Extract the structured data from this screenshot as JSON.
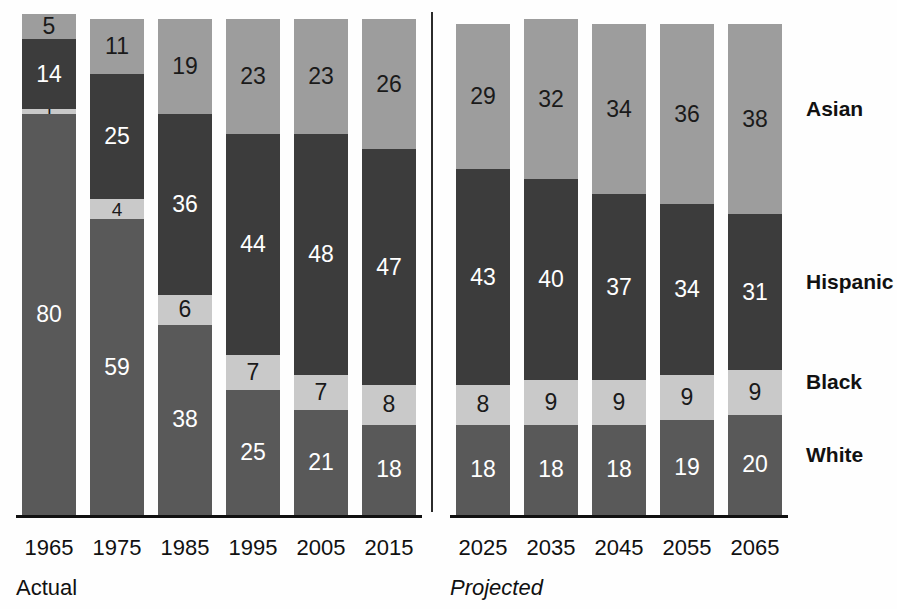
{
  "chart_data": {
    "type": "bar",
    "stacked": true,
    "stack_mode": "percent",
    "title": "",
    "subtitle": "",
    "xlabel": "",
    "ylabel": "",
    "ylim": [
      0,
      100
    ],
    "grid": false,
    "legend_position": "right",
    "categories": [
      "1965",
      "1975",
      "1985",
      "1995",
      "2005",
      "2015",
      "2025",
      "2035",
      "2045",
      "2055",
      "2065"
    ],
    "series": [
      {
        "name": "Asian",
        "color": "#9d9d9d",
        "values": [
          5,
          11,
          19,
          23,
          23,
          26,
          29,
          32,
          34,
          36,
          38
        ]
      },
      {
        "name": "Hispanic",
        "color": "#3c3c3c",
        "values": [
          14,
          25,
          36,
          44,
          48,
          47,
          43,
          40,
          37,
          34,
          31
        ]
      },
      {
        "name": "Black",
        "color": "#c9c9c9",
        "values": [
          1,
          4,
          6,
          7,
          7,
          8,
          8,
          9,
          9,
          9,
          9
        ]
      },
      {
        "name": "White",
        "color": "#595959",
        "values": [
          80,
          59,
          38,
          25,
          21,
          18,
          18,
          18,
          18,
          19,
          20
        ]
      }
    ],
    "stack_order_top_to_bottom": [
      "Asian",
      "Hispanic",
      "Black",
      "White"
    ],
    "annotations": [
      {
        "text": "Actual",
        "x_group": [
          "1965",
          "1975",
          "1985",
          "1995",
          "2005",
          "2015"
        ]
      },
      {
        "text": "Projected",
        "x_group": [
          "2025",
          "2035",
          "2045",
          "2055",
          "2065"
        ]
      }
    ]
  },
  "legend": {
    "items": [
      {
        "label": "Asian",
        "color": "#9d9d9d"
      },
      {
        "label": "Hispanic",
        "color": "#3c3c3c"
      },
      {
        "label": "Black",
        "color": "#c9c9c9"
      },
      {
        "label": "White",
        "color": "#595959"
      }
    ]
  },
  "axis": {
    "ticks": [
      "1965",
      "1975",
      "1985",
      "1995",
      "2005",
      "2015",
      "2025",
      "2035",
      "2045",
      "2055",
      "2065"
    ]
  },
  "captions": {
    "actual": "Actual",
    "projected": "Projected"
  },
  "bars": [
    {
      "year": "1965",
      "asian": "5",
      "hispanic": "14",
      "black": "1",
      "white": "80"
    },
    {
      "year": "1975",
      "asian": "11",
      "hispanic": "25",
      "black": "4",
      "white": "59"
    },
    {
      "year": "1985",
      "asian": "19",
      "hispanic": "36",
      "black": "6",
      "white": "38"
    },
    {
      "year": "1995",
      "asian": "23",
      "hispanic": "44",
      "black": "7",
      "white": "25"
    },
    {
      "year": "2005",
      "asian": "23",
      "hispanic": "48",
      "black": "7",
      "white": "21"
    },
    {
      "year": "2015",
      "asian": "26",
      "hispanic": "47",
      "black": "8",
      "white": "18"
    },
    {
      "year": "2025",
      "asian": "29",
      "hispanic": "43",
      "black": "8",
      "white": "18"
    },
    {
      "year": "2035",
      "asian": "32",
      "hispanic": "40",
      "black": "9",
      "white": "18"
    },
    {
      "year": "2045",
      "asian": "34",
      "hispanic": "37",
      "black": "9",
      "white": "18"
    },
    {
      "year": "2055",
      "asian": "36",
      "hispanic": "34",
      "black": "9",
      "white": "19"
    },
    {
      "year": "2065",
      "asian": "38",
      "hispanic": "31",
      "black": "9",
      "white": "20"
    }
  ]
}
